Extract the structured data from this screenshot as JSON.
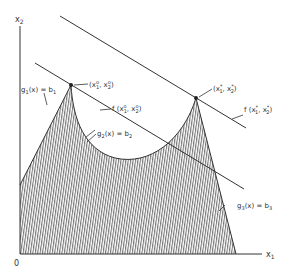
{
  "diagram": {
    "axes": {
      "x_label": "x",
      "x_label_sub": "1",
      "y_label": "x",
      "y_label_sub": "2",
      "origin_label": "0"
    },
    "points": {
      "local": {
        "label_open": "(x",
        "label_sub1": "1",
        "label_sup1": "o",
        "label_mid": ", x",
        "label_sub2": "2",
        "label_sup2": "o",
        "label_close": ")"
      },
      "optimum": {
        "label_open": "(x",
        "label_sub1": "1",
        "label_sup1": "*",
        "label_mid": ", x",
        "label_sub2": "2",
        "label_sup2": "*",
        "label_close": ")"
      }
    },
    "contours": {
      "local": {
        "label_open": "f (x",
        "label_sub1": "1",
        "label_sup1": "o",
        "label_mid": ", x",
        "label_sub2": "2",
        "label_sup2": "o",
        "label_close": ")"
      },
      "optimum": {
        "label_open": "f (x",
        "label_sub1": "1",
        "label_sup1": "*",
        "label_mid": ", x",
        "label_sub2": "2",
        "label_sup2": "*",
        "label_close": ")"
      }
    },
    "constraints": [
      {
        "g": "g",
        "sub": "1",
        "body": "(x) = b",
        "bsub": "1"
      },
      {
        "g": "g",
        "sub": "2",
        "body": "(x) = b",
        "bsub": "2"
      },
      {
        "g": "g",
        "sub": "3",
        "body": "(x) = b",
        "bsub": "3"
      }
    ],
    "colors": {
      "line": "#333333",
      "hatch": "#555555",
      "background": "#ffffff"
    }
  }
}
